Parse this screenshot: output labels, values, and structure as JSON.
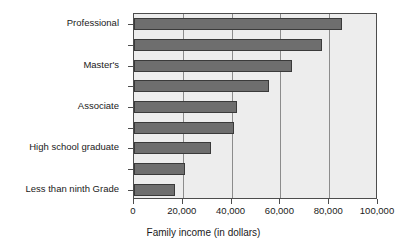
{
  "chart_data": {
    "type": "bar",
    "orientation": "horizontal",
    "title": "",
    "xlabel": "Family income (in dollars)",
    "ylabel": "",
    "xlim": [
      0,
      100000
    ],
    "ylim": null,
    "grid": true,
    "legend": null,
    "xticks": [
      {
        "value": 0,
        "label": "0"
      },
      {
        "value": 20000,
        "label": "20,000"
      },
      {
        "value": 40000,
        "label": "40,000"
      },
      {
        "value": 60000,
        "label": "60,000"
      },
      {
        "value": 80000,
        "label": "80,000"
      },
      {
        "value": 100000,
        "label": "100,000"
      }
    ],
    "categories": [
      "Professional",
      "",
      "Master's",
      "",
      "Associate",
      "",
      "High school graduate",
      "",
      "Less than ninth Grade"
    ],
    "values": [
      85200,
      77000,
      64600,
      55500,
      42400,
      41100,
      31700,
      21000,
      16900
    ],
    "bars": [
      {
        "label": "Professional",
        "value": 85200,
        "label_shown": true
      },
      {
        "label": "",
        "value": 77000,
        "label_shown": false
      },
      {
        "label": "Master's",
        "value": 64600,
        "label_shown": true
      },
      {
        "label": "",
        "value": 55500,
        "label_shown": false
      },
      {
        "label": "Associate",
        "value": 42400,
        "label_shown": true
      },
      {
        "label": "",
        "value": 41100,
        "label_shown": false
      },
      {
        "label": "High school graduate",
        "value": 31700,
        "label_shown": true
      },
      {
        "label": "",
        "value": 21000,
        "label_shown": false
      },
      {
        "label": "Less than ninth Grade",
        "value": 16900,
        "label_shown": true
      }
    ],
    "colors": {
      "bar_fill": "#6e6e6e",
      "bar_edge": "#3a3a3a",
      "plot_background": "#ededed",
      "frame": "#4d4d4d",
      "gridline": "#8c8c8c",
      "page_background": "#ffffff",
      "text": "#1a1a1a"
    }
  }
}
